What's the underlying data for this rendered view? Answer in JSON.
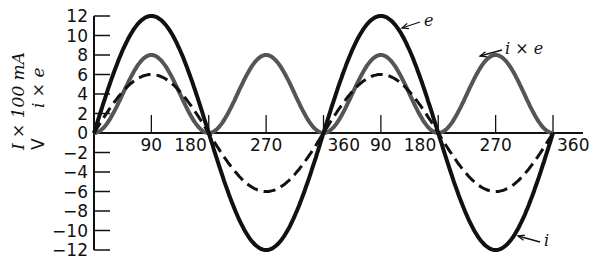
{
  "chart_data": {
    "type": "line",
    "title": "",
    "xlabel": "",
    "ylabel": [
      "I × 100 mA",
      "V",
      "i × e"
    ],
    "x_tick_labels": [
      "90",
      "180",
      "270",
      "360",
      "90",
      "180",
      "270",
      "360"
    ],
    "y_tick_labels": [
      "12",
      "10",
      "8",
      "6",
      "4",
      "2",
      "0",
      "−2",
      "−4",
      "−6",
      "−8",
      "−10",
      "−12"
    ],
    "ylim": [
      -12,
      12
    ],
    "xlim_degrees": [
      0,
      720
    ],
    "grid": false,
    "series": [
      {
        "name": "e",
        "style": "solid black thick",
        "amplitude": 12,
        "formula": "12·sin(θ)",
        "x": [
          0,
          90,
          180,
          270,
          360,
          450,
          540,
          630,
          720
        ],
        "values": [
          0,
          12,
          0,
          -12,
          0,
          12,
          0,
          -12,
          0
        ]
      },
      {
        "name": "dashed",
        "style": "dashed black",
        "amplitude": 6,
        "formula": "6·sin(θ)",
        "x": [
          0,
          90,
          180,
          270,
          360,
          450,
          540,
          630,
          720
        ],
        "values": [
          0,
          6,
          0,
          -6,
          0,
          6,
          0,
          -6,
          0
        ]
      },
      {
        "name": "i × e",
        "style": "solid gray",
        "amplitude": 8,
        "formula": "8·sin²(θ)",
        "x": [
          0,
          90,
          180,
          270,
          360,
          450,
          540,
          630,
          720
        ],
        "values": [
          0,
          8,
          0,
          8,
          0,
          8,
          0,
          8,
          0
        ]
      }
    ],
    "annotations": [
      {
        "text": "e",
        "target": "e",
        "position": "top near 150°"
      },
      {
        "text": "i × e",
        "target": "i × e",
        "position": "top near 630°"
      },
      {
        "text": "i",
        "target": "lower curve",
        "position": "bottom near 690°"
      }
    ]
  }
}
